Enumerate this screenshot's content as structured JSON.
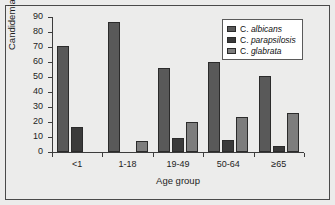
{
  "chart_data": {
    "type": "bar",
    "title": "",
    "xlabel": "Age group",
    "ylabel": "Candidemias (%)",
    "categories": [
      "<1",
      "1-18",
      "19-49",
      "50-64",
      "≥65"
    ],
    "ylim": [
      0,
      90
    ],
    "yticks": [
      0,
      10,
      20,
      30,
      40,
      50,
      60,
      70,
      80,
      90
    ],
    "grid": false,
    "legend_position": "top-right",
    "series": [
      {
        "name": "C. albicans",
        "genus": "C.",
        "species": "albicans",
        "color": "#595959",
        "values": [
          71,
          87,
          56,
          60,
          51
        ]
      },
      {
        "name": "C. parapsilosis",
        "genus": "C.",
        "species": "parapsilosis",
        "color": "#3a3a3a",
        "values": [
          17,
          0,
          9.5,
          8,
          4
        ]
      },
      {
        "name": "C. glabrata",
        "genus": "C.",
        "species": "glabrata",
        "color": "#7d7d7d",
        "values": [
          0,
          7.5,
          20,
          23.5,
          26
        ]
      }
    ]
  },
  "figure": {
    "background": "#ececeb",
    "border_color": "#4a4a4a",
    "axis_color": "#3c3c3c",
    "bar_edge_color": "#2b2b2b"
  }
}
